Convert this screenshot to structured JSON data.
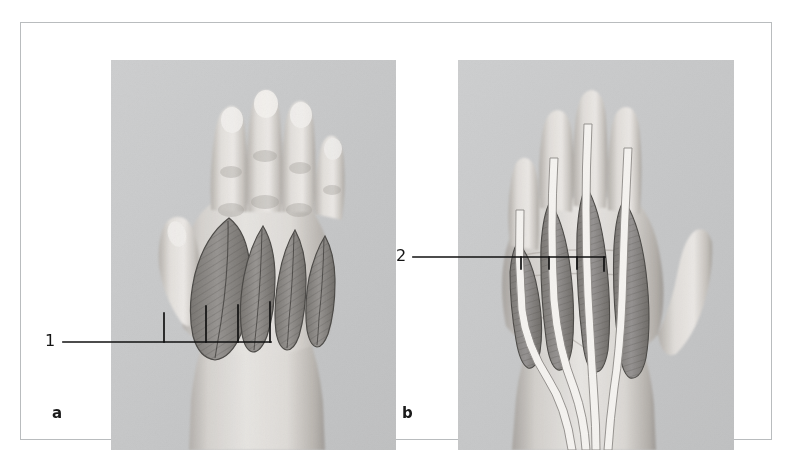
{
  "figure": {
    "type": "anatomical-photographic-illustration",
    "border_color": "#b9bcbe",
    "page_background": "#ffffff"
  },
  "panels": [
    {
      "id": "a",
      "letter": "a",
      "view": "dorsal",
      "photo_background": "#c9cacb",
      "skin_light": "#e3e1de",
      "skin_mid": "#cfcbc6",
      "skin_shadow": "#a9a5a1",
      "muscle_fill": "#8e8b87",
      "muscle_stroke": "#4a4845",
      "structures": "four leaf-shaped dorsal interossei muscles overlaid on the back of the hand",
      "muscle_count": 4
    },
    {
      "id": "b",
      "letter": "b",
      "view": "palmar",
      "photo_background": "#c9cacb",
      "skin_light": "#e3e1de",
      "skin_mid": "#cfcbc6",
      "skin_shadow": "#a9a5a1",
      "tendon_fill": "#f4f2ef",
      "tendon_stroke": "#8c8984",
      "muscle_fill": "#8e8b87",
      "muscle_stroke": "#4a4845",
      "structures": "long flexor tendons converging at the wrist with four lumbrical muscles",
      "tendon_count": 4,
      "muscle_count": 4
    }
  ],
  "callouts": [
    {
      "number": "1",
      "panel": "a",
      "leader_color": "#111111",
      "tick_count": 4,
      "points_to": "dorsal interossei muscles"
    },
    {
      "number": "2",
      "panel": "b",
      "leader_color": "#111111",
      "tick_count": 4,
      "points_to": "lumbrical muscles"
    }
  ]
}
